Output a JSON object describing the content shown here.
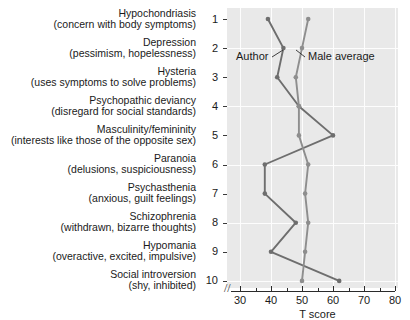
{
  "chart_data": {
    "type": "line",
    "title": "",
    "subtitle": "",
    "xlabel": "T score",
    "ylabel": "",
    "xlim": [
      27,
      80
    ],
    "ylim": [
      1,
      10
    ],
    "xticks": [
      30,
      40,
      50,
      60,
      70,
      80
    ],
    "axis_break": "//",
    "grid": true,
    "orientation": "horizontal",
    "legend_position": "inline-annotation",
    "categories": [
      "Hypochondriasis",
      "Depression",
      "Hysteria",
      "Psychopathic deviancy",
      "Masculinity/femininity",
      "Paranoia",
      "Psychasthenia",
      "Schizophrenia",
      "Hypomania",
      "Social introversion"
    ],
    "category_descriptions": [
      "(concern with body symptoms)",
      "(pessimism, hopelessness)",
      "(uses symptoms to solve problems)",
      "(disregard for social standards)",
      "(interests like those of the opposite sex)",
      "(delusions, suspiciousness)",
      "(anxious, guilt feelings)",
      "(withdrawn, bizarre thoughts)",
      "(overactive, excited, impulsive)",
      "(shy, inhibited)"
    ],
    "category_numbers": [
      "1",
      "2",
      "3",
      "4",
      "5",
      "6",
      "7",
      "8",
      "9",
      "10"
    ],
    "series": [
      {
        "name": "Author",
        "color": "#6e6e6e",
        "values": [
          39,
          44,
          42,
          49,
          60,
          38,
          38,
          48,
          40,
          62
        ]
      },
      {
        "name": "Male average",
        "color": "#8e8e8e",
        "values": [
          52,
          50,
          48,
          49,
          49,
          52,
          51,
          52,
          51,
          50
        ]
      }
    ]
  },
  "annotations": {
    "author_label": "Author",
    "male_average_label": "Male average"
  },
  "colors": {
    "plot_background": "#e9e9e9",
    "gridline": "#fdfdfd",
    "axis": "#2b2b2b",
    "author": "#6e6e6e",
    "male_average": "#8e8e8e"
  }
}
